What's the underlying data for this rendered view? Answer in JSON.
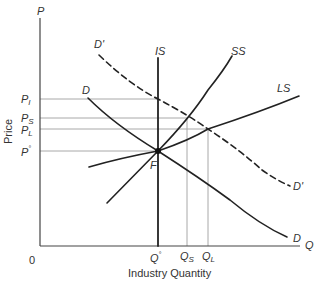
{
  "diagram": {
    "type": "supply-demand",
    "axes": {
      "y_axis_symbol": "P",
      "x_axis_symbol": "Q",
      "origin": "0",
      "y_title": "Price",
      "x_title": "Industry Quantity"
    },
    "price_levels": [
      {
        "name": "P_I",
        "base": "P",
        "sub": "I"
      },
      {
        "name": "P_S",
        "base": "P",
        "sub": "S"
      },
      {
        "name": "P_L",
        "base": "P",
        "sub": "L"
      },
      {
        "name": "P°",
        "base": "P",
        "sup": "°"
      }
    ],
    "quantity_levels": [
      {
        "name": "Q°",
        "base": "Q",
        "sup": "°"
      },
      {
        "name": "Q_S",
        "base": "Q",
        "sub": "S"
      },
      {
        "name": "Q_L",
        "base": "Q",
        "sub": "L"
      }
    ],
    "curves": [
      {
        "label": "D",
        "kind": "demand",
        "style": "solid"
      },
      {
        "label": "D'",
        "kind": "shifted-demand",
        "style": "dashed"
      },
      {
        "label": "IS",
        "kind": "immediate-supply",
        "style": "solid-vertical"
      },
      {
        "label": "SS",
        "kind": "short-run-supply",
        "style": "solid"
      },
      {
        "label": "LS",
        "kind": "long-run-supply",
        "style": "solid"
      }
    ],
    "point": {
      "label": "F",
      "meaning": "initial equilibrium"
    },
    "colors": {
      "curve": "#222222",
      "guide_line": "#a8a8a8",
      "axis": "#444444",
      "text": "#333333"
    }
  }
}
